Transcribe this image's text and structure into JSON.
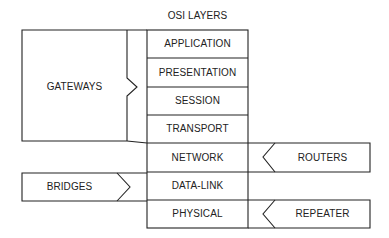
{
  "title": "OSI LAYERS",
  "layers": [
    {
      "label": "APPLICATION"
    },
    {
      "label": "PRESENTATION"
    },
    {
      "label": "SESSION"
    },
    {
      "label": "TRANSPORT"
    },
    {
      "label": "NETWORK"
    },
    {
      "label": "DATA-LINK"
    },
    {
      "label": "PHYSICAL"
    }
  ],
  "devices": {
    "gateways": {
      "label": "GATEWAYS",
      "spans_layers": [
        "APPLICATION",
        "PRESENTATION",
        "SESSION",
        "TRANSPORT"
      ]
    },
    "routers": {
      "label": "ROUTERS",
      "layer": "NETWORK"
    },
    "bridges": {
      "label": "BRIDGES",
      "layer": "DATA-LINK"
    },
    "repeater": {
      "label": "REPEATER",
      "layer": "PHYSICAL"
    }
  },
  "colors": {
    "line": "#222222",
    "text": "#222222",
    "background": "#ffffff"
  }
}
